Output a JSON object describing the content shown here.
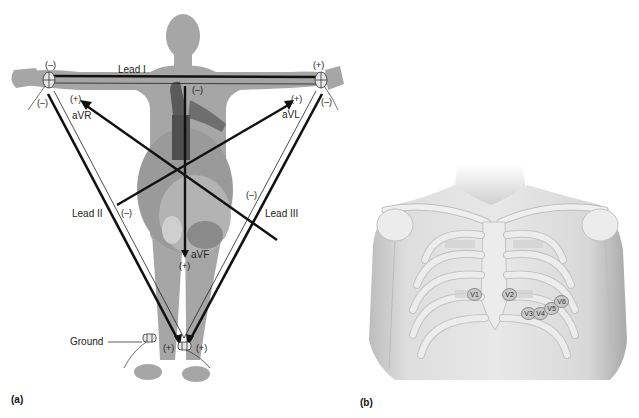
{
  "panel_a": {
    "letter": "(a)",
    "title": "Limb leads (Einthoven's triangle and augmented leads)",
    "labels": {
      "lead_i": "Lead I",
      "lead_ii": "Lead II",
      "lead_iii": "Lead III",
      "avr": "aVR",
      "avl": "aVL",
      "avf": "aVF",
      "ground": "Ground"
    },
    "polarity": {
      "right_arm_top": "(–)",
      "right_arm_bottom": "(–)",
      "left_arm_top": "(+)",
      "left_arm_bottom": "(–)",
      "avr_plus": "(+)",
      "avl_plus": "(+)",
      "avf_minus": "(–)",
      "avf_plus": "(+)",
      "lead_ii_minus": "(–)",
      "lead_iii_minus": "(–)",
      "left_leg_left": "(+)",
      "left_leg_right": "(+)"
    },
    "colors": {
      "silhouette": "#a6a6a6",
      "lead_line": "#111111",
      "heart": "#8a8a8a"
    }
  },
  "panel_b": {
    "letter": "(b)",
    "title": "Precordial (chest) lead placement",
    "electrodes": [
      "V1",
      "V2",
      "V3",
      "V4",
      "V5",
      "V6"
    ],
    "colors": {
      "skin": "#d9d9d9",
      "bone": "#ececec",
      "electrode": "#c9c9c9"
    }
  }
}
